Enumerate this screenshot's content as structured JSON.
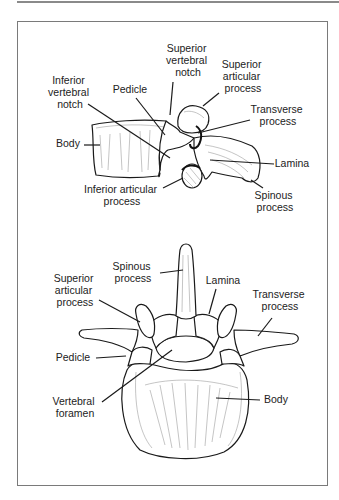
{
  "figure": {
    "lateral_view": {
      "labels": {
        "superior_vertebral_notch": [
          "Superior",
          "vertebral",
          "notch"
        ],
        "superior_articular_process": [
          "Superior",
          "articular",
          "process"
        ],
        "inferior_vertebral_notch": [
          "Inferior",
          "vertebral",
          "notch"
        ],
        "pedicle": [
          "Pedicle"
        ],
        "transverse_process": [
          "Transverse",
          "process"
        ],
        "body": [
          "Body"
        ],
        "lamina": [
          "Lamina"
        ],
        "inferior_articular_process": [
          "Inferior articular",
          "process"
        ],
        "spinous_process": [
          "Spinous",
          "process"
        ]
      }
    },
    "superior_view": {
      "labels": {
        "spinous_process": [
          "Spinous",
          "process"
        ],
        "superior_articular_process": [
          "Superior",
          "articular",
          "process"
        ],
        "lamina": [
          "Lamina"
        ],
        "transverse_process": [
          "Transverse",
          "process"
        ],
        "pedicle": [
          "Pedicle"
        ],
        "vertebral_foramen": [
          "Vertebral",
          "foramen"
        ],
        "body": [
          "Body"
        ]
      }
    }
  },
  "colors": {
    "frame": "#7a7a7a",
    "line": "#1a1a1a",
    "text": "#222222"
  }
}
